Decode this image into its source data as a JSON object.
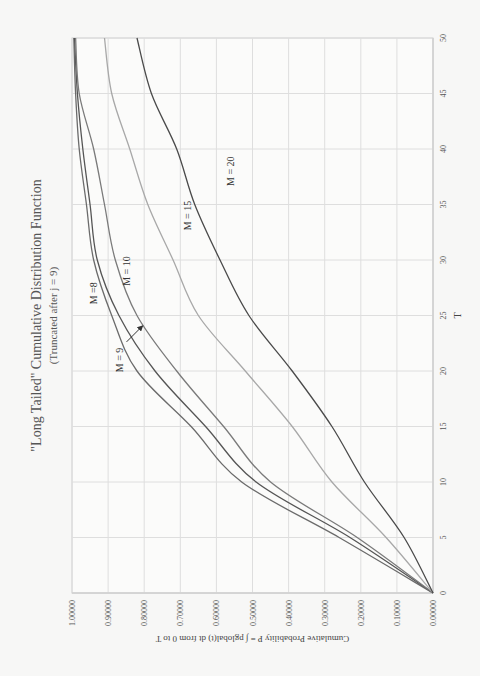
{
  "chart_data": {
    "type": "line",
    "orientation_note": "figure is rotated 90 degrees counter-clockwise on the page",
    "title": "\"Long Tailed\" Cumulative Distribution Function",
    "subtitle": "(Truncated after j = 9)",
    "xlabel": "T",
    "ylabel": "Cumulative Probability P = ∫ pglobal(t) dt from 0 to T",
    "xlim": [
      0,
      50
    ],
    "ylim": [
      0,
      1
    ],
    "x_ticks": [
      "0",
      "5",
      "10",
      "15",
      "20",
      "25",
      "30",
      "35",
      "40",
      "45",
      "50"
    ],
    "y_ticks": [
      "0.00000",
      "0.10000",
      "0.20000",
      "0.30000",
      "0.40000",
      "0.50000",
      "0.60000",
      "0.70000",
      "0.80000",
      "0.90000",
      "1.00000"
    ],
    "grid": true,
    "legend": "inline labels",
    "x": [
      0,
      5,
      10,
      15,
      20,
      25,
      30,
      35,
      40,
      45,
      50
    ],
    "series": [
      {
        "name": "M =8",
        "color": "#6b6b6b",
        "values": [
          0,
          0.26,
          0.53,
          0.67,
          0.82,
          0.89,
          0.94,
          0.96,
          0.98,
          0.99,
          0.995
        ]
      },
      {
        "name": "M = 9",
        "color": "#555555",
        "values": [
          0,
          0.23,
          0.49,
          0.63,
          0.77,
          0.87,
          0.93,
          0.95,
          0.97,
          0.985,
          0.993
        ]
      },
      {
        "name": "M = 10",
        "color": "#7a7a7a",
        "values": [
          0,
          0.21,
          0.45,
          0.58,
          0.71,
          0.82,
          0.88,
          0.91,
          0.94,
          0.98,
          0.99
        ]
      },
      {
        "name": "M = 15",
        "color": "#a8a8a8",
        "values": [
          0,
          0.13,
          0.28,
          0.39,
          0.52,
          0.65,
          0.72,
          0.79,
          0.84,
          0.89,
          0.91
        ]
      },
      {
        "name": "M = 20",
        "color": "#4a4a4a",
        "values": [
          0,
          0.08,
          0.19,
          0.28,
          0.39,
          0.51,
          0.59,
          0.66,
          0.71,
          0.78,
          0.82
        ]
      }
    ],
    "annotations": [
      {
        "text": "M =8",
        "x": 27,
        "y": 0.93
      },
      {
        "text": "M = 9",
        "x": 21,
        "y": 0.86,
        "arrow": true
      },
      {
        "text": "M = 10",
        "x": 29,
        "y": 0.84
      },
      {
        "text": "M = 15",
        "x": 34,
        "y": 0.67
      },
      {
        "text": "M = 20",
        "x": 38,
        "y": 0.55
      }
    ]
  }
}
